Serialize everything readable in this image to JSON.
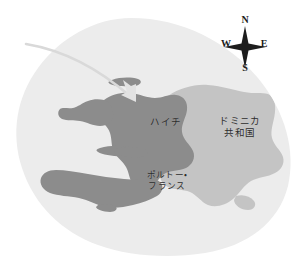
{
  "map": {
    "title": "ハイチ地図",
    "background_color": "#ffffff",
    "blob_color": "#ececec",
    "haiti_color": "#8c8c8c",
    "dominican_color": "#c4c4c4",
    "arrow_color": "#d9d9d9",
    "label_color": "#2b2b2b",
    "labels": {
      "haiti": "ハイチ",
      "dominican_line1": "ドミニカ",
      "dominican_line2": "共和国",
      "port_au_prince_line1": "ポルトー・",
      "port_au_prince_line2": "フランス"
    },
    "compass": {
      "north": "N",
      "south": "S",
      "west": "W",
      "east": "E",
      "star_color": "#1d1d1d"
    },
    "marker": {
      "name": "port-au-prince-pin",
      "color": "#2b2b2b"
    }
  }
}
